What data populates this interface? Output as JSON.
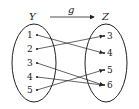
{
  "diagram": {
    "function_name": "g",
    "domain_set": {
      "name": "Y",
      "elements": [
        "1",
        "2",
        "3",
        "4",
        "5"
      ]
    },
    "codomain_set": {
      "name": "Z",
      "elements": [
        "3",
        "4",
        "5",
        "6"
      ]
    },
    "mappings": [
      {
        "from": "1",
        "to": "4"
      },
      {
        "from": "2",
        "to": "3"
      },
      {
        "from": "3",
        "to": "6"
      },
      {
        "from": "4",
        "to": "6"
      },
      {
        "from": "5",
        "to": "5"
      }
    ],
    "colors": {
      "stroke": "#222222",
      "background": "#ffffff"
    }
  }
}
